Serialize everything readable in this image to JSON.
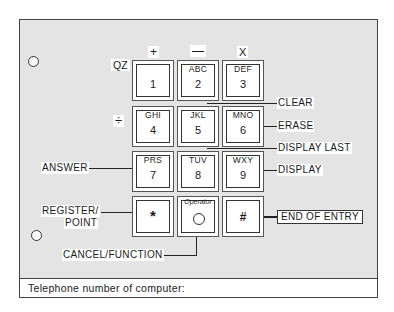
{
  "diagram": {
    "footer_text": "Telephone number of computer:",
    "operators": {
      "plus": "+",
      "minus": "—",
      "multiply": "X",
      "divide": "÷",
      "qz": "QZ"
    },
    "keys": [
      {
        "letters": "",
        "digit": "1"
      },
      {
        "letters": "ABC",
        "digit": "2"
      },
      {
        "letters": "DEF",
        "digit": "3"
      },
      {
        "letters": "GHI",
        "digit": "4"
      },
      {
        "letters": "JKL",
        "digit": "5"
      },
      {
        "letters": "MNO",
        "digit": "6"
      },
      {
        "letters": "PRS",
        "digit": "7"
      },
      {
        "letters": "TUV",
        "digit": "8"
      },
      {
        "letters": "WXY",
        "digit": "9"
      },
      {
        "symbol": "*"
      },
      {
        "arc_label": "Operator",
        "symbol": "O"
      },
      {
        "symbol": "#"
      }
    ],
    "callouts": {
      "clear": "CLEAR",
      "erase": "ERASE",
      "display_last": "DISPLAY LAST",
      "display": "DISPLAY",
      "answer": "ANSWER",
      "register_point_1": "REGISTER/",
      "register_point_2": "POINT",
      "end_of_entry": "END OF ENTRY",
      "cancel_function": "CANCEL/FUNCTION"
    },
    "colors": {
      "background": "#ffffff",
      "panel_stipple": "#e4e4e4",
      "line": "#222222"
    }
  }
}
